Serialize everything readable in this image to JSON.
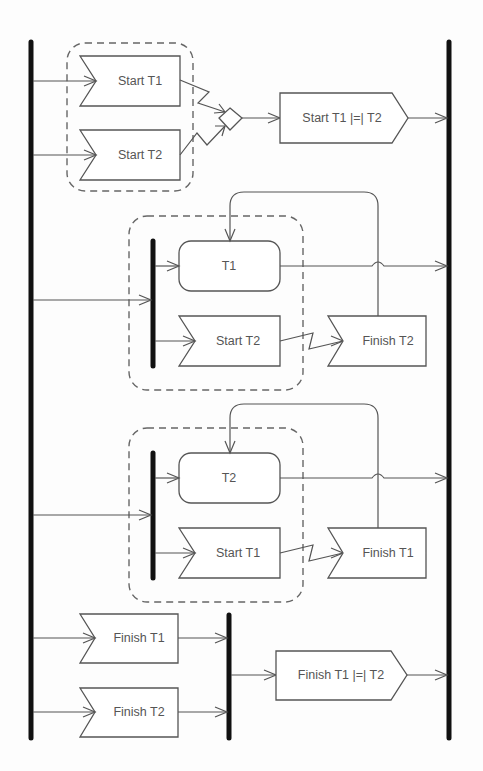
{
  "diagram": {
    "type": "UML activity diagram",
    "sections": [
      {
        "id": "start-sync",
        "receive_signals": [
          "Start T1",
          "Start T2"
        ],
        "merge": "diamond",
        "send_signal": "Start T1 |=| T2"
      },
      {
        "id": "t1-branch",
        "action": "T1",
        "receive_signal": "Start T2",
        "receive_signal_2": "Finish T2"
      },
      {
        "id": "t2-branch",
        "action": "T2",
        "receive_signal": "Start T1",
        "receive_signal_2": "Finish T1"
      },
      {
        "id": "finish-sync",
        "receive_signals": [
          "Finish T1",
          "Finish T2"
        ],
        "send_signal": "Finish T1 |=| T2"
      }
    ]
  },
  "labels": {
    "s1_start_t1": "Start T1",
    "s1_start_t2": "Start T2",
    "s1_send": "Start T1 |=| T2",
    "s2_action": "T1",
    "s2_start_t2": "Start T2",
    "s2_finish_t2": "Finish T2",
    "s3_action": "T2",
    "s3_start_t1": "Start T1",
    "s3_finish_t1": "Finish T1",
    "s4_finish_t1": "Finish T1",
    "s4_finish_t2": "Finish T2",
    "s4_send": "Finish T1 |=| T2"
  }
}
